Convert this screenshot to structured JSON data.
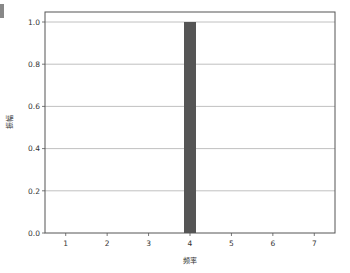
{
  "chart_data": {
    "type": "bar",
    "title": "",
    "xlabel": "频率",
    "ylabel": "振幅",
    "categories": [
      "1",
      "2",
      "3",
      "4",
      "5",
      "6",
      "7"
    ],
    "x": [
      1,
      2,
      3,
      4,
      5,
      6,
      7
    ],
    "values": [
      0,
      0,
      0,
      1.0,
      0,
      0,
      0
    ],
    "xlim": [
      0.5,
      7.5
    ],
    "ylim": [
      0.0,
      1.05
    ],
    "yticks": [
      "0.0",
      "0.2",
      "0.4",
      "0.6",
      "0.8",
      "1.0"
    ],
    "xticks": [
      "1",
      "2",
      "3",
      "4",
      "5",
      "6",
      "7"
    ],
    "grid": "horizontal",
    "bar_color": "#555555",
    "grid_color": "#b0b0b0",
    "legend": null
  }
}
